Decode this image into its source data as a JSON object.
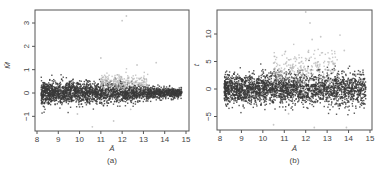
{
  "chart_data": [
    {
      "type": "scatter",
      "panel_label": "(a)",
      "title": "",
      "xlabel": "Ā",
      "ylabel": "M̄",
      "xlim": [
        8,
        15
      ],
      "ylim": [
        -1.6,
        3.5
      ],
      "xticks": [
        8,
        9,
        10,
        11,
        12,
        13,
        14,
        15
      ],
      "yticks": [
        -1,
        0,
        1,
        2,
        3
      ],
      "grid": false,
      "legend": null,
      "description": "MA-style scatter: dense dark cloud centered at M≈0 spanning A≈8.2–14.8, spread narrowing with A; lighter grey points concentrated around A≈11.5–13, M≈0.3–0.8; a few sparse outliers up to M≈3.3 and down to M≈-1.4",
      "series": [
        {
          "name": "dark points",
          "color": "#3a3a3a",
          "x_range": [
            8.2,
            14.8
          ],
          "y_center": 0,
          "y_spread_at": {
            "8.5": 0.45,
            "10": 0.45,
            "12": 0.35,
            "14": 0.2
          }
        },
        {
          "name": "light points",
          "color": "#b0b0b0",
          "x_range": [
            11.0,
            13.2
          ],
          "y_center": 0.45,
          "y_spread": 0.3
        },
        {
          "name": "outliers",
          "color": "#c8c8c8",
          "points": [
            [
              12.2,
              3.3
            ],
            [
              12.0,
              3.1
            ],
            [
              11.0,
              1.5
            ],
            [
              12.7,
              1.2
            ],
            [
              13.6,
              1.3
            ],
            [
              9.9,
              -0.9
            ],
            [
              10.6,
              -1.45
            ],
            [
              11.6,
              -1.2
            ],
            [
              12.4,
              -0.7
            ]
          ]
        }
      ]
    },
    {
      "type": "scatter",
      "panel_label": "(b)",
      "title": "",
      "xlabel": "Ā",
      "ylabel": "t",
      "xlim": [
        8,
        15
      ],
      "ylim": [
        -8,
        14.5
      ],
      "xticks": [
        8,
        9,
        10,
        11,
        12,
        13,
        14,
        15
      ],
      "yticks": [
        -5,
        0,
        5,
        10
      ],
      "grid": false,
      "legend": null,
      "description": "Scatter of t-statistic vs Ā: dense dark band between t≈-3 and t≈3 from A≈8.2 to 13, sparser dark points to A≈14.8; lighter grey points scattered above up to t≈14 around A≈12–13",
      "series": [
        {
          "name": "dark points",
          "color": "#3a3a3a",
          "x_range": [
            8.2,
            14.8
          ],
          "y_center": 0,
          "y_spread": 2.5
        },
        {
          "name": "light points",
          "color": "#b0b0b0",
          "x_range": [
            10.5,
            13.5
          ],
          "y_center": 3.5,
          "y_spread": 3
        },
        {
          "name": "outliers",
          "color": "#c8c8c8",
          "points": [
            [
              12.0,
              14.0
            ],
            [
              12.2,
              12.0
            ],
            [
              12.3,
              9.0
            ],
            [
              13.6,
              9.8
            ],
            [
              12.7,
              9.5
            ],
            [
              13.8,
              7.0
            ],
            [
              10.5,
              -6.5
            ],
            [
              12.4,
              -7.0
            ],
            [
              13.9,
              -7.0
            ],
            [
              11.2,
              -4.5
            ]
          ]
        }
      ]
    }
  ]
}
